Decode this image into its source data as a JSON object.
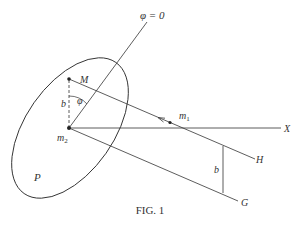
{
  "figure": {
    "caption": "FIG. 1",
    "colors": {
      "stroke": "#333333",
      "background": "#ffffff"
    },
    "labels": {
      "phi_zero": "φ = 0",
      "M": "M",
      "phi": "φ",
      "b_left": "b",
      "m2_base": "m",
      "m2_sub": "2",
      "m1_base": "m",
      "m1_sub": "1",
      "X": "X",
      "H": "H",
      "G": "G",
      "b_right": "b",
      "P": "P"
    }
  }
}
